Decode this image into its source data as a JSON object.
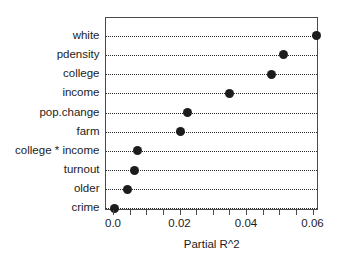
{
  "chart_data": {
    "type": "scatter",
    "subtype": "cleveland-dot-plot",
    "title": "",
    "xlabel": "Partial R^2",
    "ylabel": "",
    "categories": [
      "white",
      "pdensity",
      "college",
      "income",
      "pop.change",
      "farm",
      "college * income",
      "turnout",
      "older",
      "crime"
    ],
    "values": [
      0.061,
      0.0512,
      0.0475,
      0.035,
      0.0222,
      0.02,
      0.0072,
      0.0063,
      0.0042,
      0.0003
    ],
    "points": [
      {
        "label": "white",
        "value": 0.061
      },
      {
        "label": "pdensity",
        "value": 0.0512
      },
      {
        "label": "college",
        "value": 0.0475
      },
      {
        "label": "income",
        "value": 0.035
      },
      {
        "label": "pop.change",
        "value": 0.0222
      },
      {
        "label": "farm",
        "value": 0.02
      },
      {
        "label": "college * income",
        "value": 0.0072
      },
      {
        "label": "turnout",
        "value": 0.0063
      },
      {
        "label": "older",
        "value": 0.0042
      },
      {
        "label": "crime",
        "value": 0.0003
      }
    ],
    "xlim": [
      -0.0021,
      0.0619
    ],
    "xticks": [
      0.0,
      0.005,
      0.01,
      0.015,
      0.02,
      0.025,
      0.03,
      0.035,
      0.04,
      0.045,
      0.05,
      0.055,
      0.06
    ],
    "xtick_labels_major": [
      "0.0",
      "0.02",
      "0.04",
      "0.06"
    ],
    "xticks_major": [
      0.0,
      0.02,
      0.04,
      0.06
    ],
    "grid": "horizontal-dotted",
    "legend": "none",
    "marker": "filled-circle",
    "marker_color": "#1c1c1c",
    "frame_color": "#4a4a4a",
    "background": "#ffffff"
  },
  "axis": {
    "x_title": "Partial R^2"
  }
}
